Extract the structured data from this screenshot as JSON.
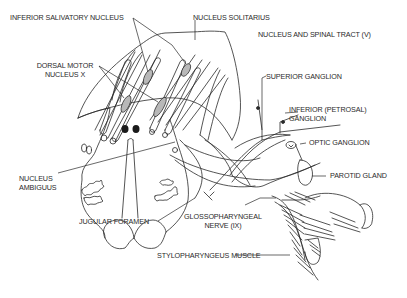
{
  "diagram": {
    "type": "anatomical illustration",
    "colors": {
      "line": "#2a2a2a",
      "nucleus_fill": "#b8b8b8",
      "background": "#ffffff"
    },
    "labels": {
      "inferior_salivatory_nucleus": "INFERIOR SALIVATORY NUCLEUS",
      "nucleus_solitarius": "NUCLEUS SOLITARIUS",
      "nucleus_spinal_tract": "NUCLEUS AND SPINAL TRACT (V)",
      "dorsal_motor_line1": "DORSAL MOTOR",
      "dorsal_motor_line2": "NUCLEUS  X",
      "superior_ganglion": "SUPERIOR GANGLION",
      "inferior_ganglion_line1": "INFERIOR (PETROSAL)",
      "inferior_ganglion_line2": "GANGLION",
      "optic_ganglion": "OPTIC GANGLION",
      "parotid_gland": "PAROTID GLAND",
      "nucleus_ambiguus_line1": "NUCLEUS",
      "nucleus_ambiguus_line2": "AMBIGUUS",
      "jugular_foramen": "JUGULAR FORAMEN",
      "glossopharyngeal_line1": "GLOSSOPHARYNGEAL",
      "glossopharyngeal_line2": "NERVE (IX)",
      "stylopharyngeus": "STYLOPHARYNGEUS MUSCLE"
    }
  }
}
